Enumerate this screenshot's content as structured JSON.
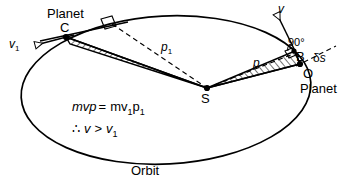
{
  "figure": {
    "domain": "diagram",
    "width": 343,
    "height": 187,
    "background_color": "#ffffff",
    "stroke_color": "#000000"
  },
  "labels": {
    "planet_c": "Planet",
    "point_c": "C",
    "velocity_v1": "v",
    "velocity_v1_sub": "1",
    "perpendicular_p1": "p",
    "perpendicular_p1_sub": "1",
    "velocity_v": "v",
    "right_angle": "90°",
    "point_b": "B",
    "arc_ds_delta": "δ",
    "arc_ds_s": "s",
    "perpendicular_p": "p",
    "point_o": "O",
    "planet_o": "Planet",
    "sun_s": "S",
    "orbit": "Orbit"
  },
  "equations": {
    "line1_parts": {
      "m": "m",
      "v": "v",
      "p": "p",
      "equals": "=",
      "m2": "m",
      "v2": "v",
      "v2_sub": "1",
      "p2": "p",
      "p2_sub": "1"
    },
    "line1_plain": "mvp = mv1p1",
    "line2_parts": {
      "therefore": "∴",
      "v": "v",
      "gt": ">",
      "v1": "v",
      "v1_sub": "1"
    },
    "line2_plain": "∴ v > v1"
  },
  "geometry": {
    "orbit_ellipse": {
      "cx": 166,
      "cy": 90,
      "rx": 145,
      "ry": 74,
      "rotation_deg": -3
    },
    "points": {
      "C": {
        "x": 66,
        "y": 37,
        "name": "planet-position-c"
      },
      "S": {
        "x": 207,
        "y": 88,
        "name": "sun-focus-s"
      },
      "O": {
        "x": 300,
        "y": 64,
        "name": "planet-position-o"
      },
      "B": {
        "x": 293,
        "y": 50,
        "name": "foot-of-perpendicular-b"
      }
    },
    "vectors": {
      "v1": {
        "from_x": 72,
        "from_y": 36,
        "to_x": 33,
        "to_y": 46,
        "label": "v1"
      },
      "v": {
        "from_x": 296,
        "from_y": 52,
        "to_x": 275,
        "to_y": 12,
        "label": "v"
      }
    },
    "swept_areas": [
      {
        "name": "swept-area-c-s",
        "vertices": "C,S",
        "hatched": true
      },
      {
        "name": "swept-area-o-s",
        "vertices": "O,B,S",
        "hatched": true
      }
    ],
    "dashed_lines": [
      {
        "name": "perpendicular-distance-p1",
        "from": "C-tangent",
        "to": "S"
      },
      {
        "name": "perpendicular-distance-p",
        "from": "B",
        "to": "S"
      },
      {
        "name": "arc-element-delta-s",
        "from": "B",
        "to": "right"
      }
    ]
  }
}
